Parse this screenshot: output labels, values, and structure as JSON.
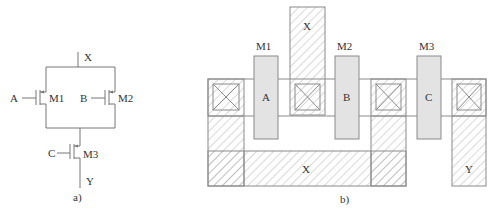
{
  "schematic": {
    "caption": "a)",
    "nodes": {
      "top": "X",
      "bottom": "Y"
    },
    "transistors": [
      {
        "name": "M1",
        "gate": "A"
      },
      {
        "name": "M2",
        "gate": "B"
      },
      {
        "name": "M3",
        "gate": "C"
      }
    ]
  },
  "layout": {
    "caption": "b)",
    "transistor_labels": [
      "M1",
      "M2",
      "M3"
    ],
    "gate_labels": [
      "A",
      "B",
      "C"
    ],
    "metal_labels": {
      "top_x": "X",
      "bottom_x": "X",
      "y": "Y"
    }
  },
  "colors": {
    "line": "#8a8a8a",
    "gate_fill": "#e3e3e3",
    "hatch": "#9a9a9a",
    "text": "#333333"
  }
}
